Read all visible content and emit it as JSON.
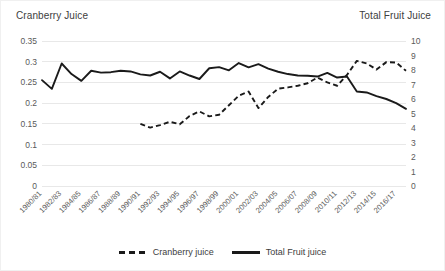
{
  "titles": {
    "left_axis": "Cranberry Juice",
    "right_axis": "Total Fruit Juice"
  },
  "legend": {
    "items": [
      {
        "label": "Cranberry juice",
        "style": "dashed"
      },
      {
        "label": "Total Fruit juice",
        "style": "solid"
      }
    ]
  },
  "chart_data": {
    "type": "line",
    "title": "",
    "xlabel": "",
    "grid": true,
    "legend_position": "bottom",
    "x": [
      "1980/81",
      "1981/82",
      "1982/83",
      "1983/84",
      "1984/85",
      "1985/86",
      "1986/87",
      "1987/88",
      "1988/89",
      "1989/90",
      "1990/91",
      "1991/92",
      "1992/93",
      "1993/94",
      "1994/95",
      "1995/96",
      "1996/97",
      "1997/98",
      "1998/99",
      "1999/00",
      "2000/01",
      "2001/02",
      "2002/03",
      "2003/04",
      "2004/05",
      "2005/06",
      "2006/07",
      "2007/08",
      "2008/09",
      "2009/10",
      "2010/11",
      "2011/12",
      "2012/13",
      "2013/14",
      "2014/15",
      "2015/16",
      "2016/17",
      "2017/18"
    ],
    "xtick_labels": [
      "1980/81",
      "1982/83",
      "1984/85",
      "1986/87",
      "1988/89",
      "1990/91",
      "1992/93",
      "1994/95",
      "1996/97",
      "1998/99",
      "2000/01",
      "2002/03",
      "2004/05",
      "2006/07",
      "2008/09",
      "2010/11",
      "2012/13",
      "2014/15",
      "2016/17"
    ],
    "axes": [
      {
        "id": "left",
        "label": "Cranberry Juice",
        "ylim": [
          0,
          0.35
        ],
        "ticks": [
          0,
          0.05,
          0.1,
          0.15,
          0.2,
          0.25,
          0.3,
          0.35
        ],
        "tick_labels": [
          "0",
          "0.05",
          "0.1",
          "0.15",
          "0.2",
          "0.25",
          "0.3",
          "0.35"
        ]
      },
      {
        "id": "right",
        "label": "Total Fruit Juice",
        "ylim": [
          0,
          10
        ],
        "ticks": [
          0,
          1,
          2,
          3,
          4,
          5,
          6,
          7,
          8,
          9,
          10
        ],
        "tick_labels": [
          "0",
          "1",
          "2",
          "3",
          "4",
          "5",
          "6",
          "7",
          "8",
          "9",
          "10"
        ]
      }
    ],
    "series": [
      {
        "name": "Cranberry juice",
        "axis": "left",
        "style": "dashed",
        "color": "#1a1a1a",
        "values": [
          null,
          null,
          null,
          null,
          null,
          null,
          null,
          null,
          null,
          null,
          0.15,
          0.141,
          0.147,
          0.155,
          0.149,
          0.169,
          0.18,
          0.168,
          0.172,
          0.195,
          0.218,
          0.228,
          0.188,
          0.215,
          0.235,
          0.238,
          0.242,
          0.248,
          0.262,
          0.25,
          0.242,
          0.268,
          0.302,
          0.296,
          0.281,
          0.299,
          0.298,
          0.278
        ]
      },
      {
        "name": "Total Fruit juice",
        "axis": "right",
        "style": "solid",
        "color": "#1a1a1a",
        "values": [
          7.3,
          6.7,
          8.45,
          7.72,
          7.25,
          7.95,
          7.82,
          7.85,
          7.95,
          7.9,
          7.7,
          7.62,
          7.88,
          7.42,
          7.9,
          7.62,
          7.38,
          8.12,
          8.2,
          7.98,
          8.48,
          8.18,
          8.4,
          8.1,
          7.88,
          7.72,
          7.62,
          7.6,
          7.55,
          7.8,
          7.48,
          7.55,
          6.52,
          6.45,
          6.2,
          6.0,
          5.72,
          5.32
        ]
      }
    ]
  }
}
